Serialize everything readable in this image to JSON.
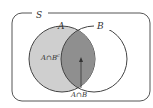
{
  "diagram": {
    "type": "venn",
    "universe_label": "S",
    "set_a_label": "A",
    "set_b_label": "B",
    "region_a_only_label": "A∩B",
    "region_a_only_sup": "c",
    "intersection_label": "A∩B",
    "colors": {
      "a_only_fill": "#cfcfcf",
      "intersection_fill": "#8f8f8f",
      "outline": "#444444",
      "background": "#ffffff"
    }
  }
}
